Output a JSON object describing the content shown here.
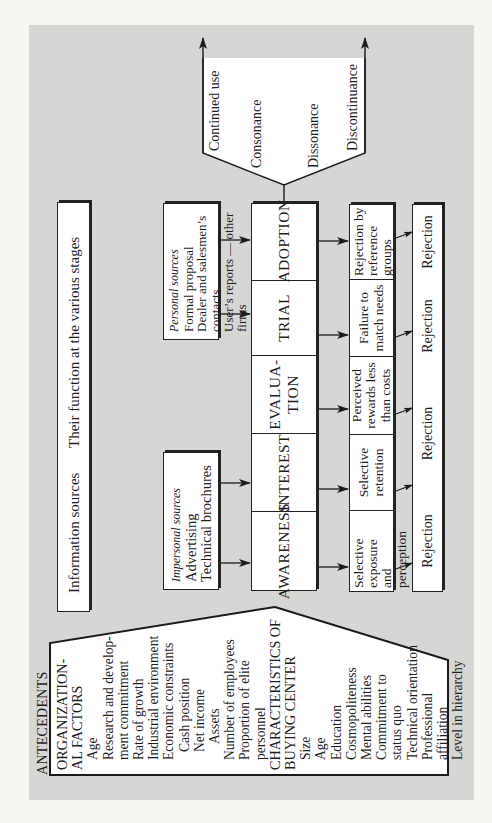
{
  "diagram": {
    "orientation": "rotated -90deg",
    "info_bar": {
      "left": "Information sources",
      "right": "Their function at the various stages"
    },
    "impersonal_sources": {
      "title": "Impersonal sources",
      "items": [
        "Advertising",
        "Technical brochures"
      ]
    },
    "personal_sources": {
      "title": "Personal sources",
      "items": [
        "Formal proposal",
        "Dealer and salesmen’s contacts",
        "User’s reports — other firms"
      ]
    },
    "stages": [
      {
        "label": "AWARENESS"
      },
      {
        "label": "INTEREST"
      },
      {
        "label": "EVALUA-\nTION",
        "line1": "EVALUA-",
        "line2": "TION"
      },
      {
        "label": "TRIAL"
      },
      {
        "label": "ADOPTION"
      }
    ],
    "rejection_reasons": [
      {
        "lines": [
          "Selective",
          "exposure",
          "and perception"
        ]
      },
      {
        "lines": [
          "Selective",
          "retention"
        ]
      },
      {
        "lines": [
          "Perceived",
          "rewards less",
          "than costs"
        ]
      },
      {
        "lines": [
          "Failure to",
          "match needs"
        ]
      },
      {
        "lines": [
          "Rejection by",
          "reference",
          "groups"
        ]
      }
    ],
    "rejection_bar": {
      "labels": [
        "Rejection",
        "Rejection",
        "Rejection",
        "Rejection"
      ]
    },
    "outcomes": {
      "continued_use": "Continued use",
      "consonance": "Consonance",
      "dissonance": "Dissonance",
      "discontinuance": "Discontinuance"
    },
    "antecedents": {
      "title": "ANTECEDENTS",
      "sections": [
        {
          "heading_lines": [
            "ORGANIZATION-",
            "AL FACTORS"
          ],
          "items": [
            {
              "text": "Age",
              "indent": 1
            },
            {
              "text": "Research and develop-",
              "indent": 1
            },
            {
              "text": "ment commitment",
              "indent": 1
            },
            {
              "text": "Rate of growth",
              "indent": 1
            },
            {
              "text": "Industrial environment",
              "indent": 1
            },
            {
              "text": "Economic constraints",
              "indent": 1
            },
            {
              "text": "Cash position",
              "indent": 2
            },
            {
              "text": "Net income",
              "indent": 2
            },
            {
              "text": "Assets",
              "indent": 3
            },
            {
              "text": "Number of employees",
              "indent": 1
            },
            {
              "text": "Proportion of elite",
              "indent": 1
            },
            {
              "text": "personnel",
              "indent": 1
            }
          ]
        },
        {
          "heading_lines": [
            "CHARACTERISTICS OF",
            "BUYING CENTER"
          ],
          "items": [
            {
              "text": "Size",
              "indent": 1
            },
            {
              "text": "Age",
              "indent": 1
            },
            {
              "text": "Education",
              "indent": 1
            },
            {
              "text": "Cosmopoliteness",
              "indent": 1
            },
            {
              "text": "Mental abilities",
              "indent": 1
            },
            {
              "text": "Commitment to",
              "indent": 1
            },
            {
              "text": "status quo",
              "indent": 1
            },
            {
              "text": "Technical orientation",
              "indent": 1
            },
            {
              "text": "Professional",
              "indent": 1
            },
            {
              "text": "affiliation",
              "indent": 1
            },
            {
              "text": "Level in hierarchy",
              "indent": 1
            }
          ]
        }
      ]
    },
    "colors": {
      "page_background": "#f7f5ef",
      "panel_gray": "#d6d6d4",
      "box_fill": "#ffffff",
      "line": "#222222"
    }
  }
}
